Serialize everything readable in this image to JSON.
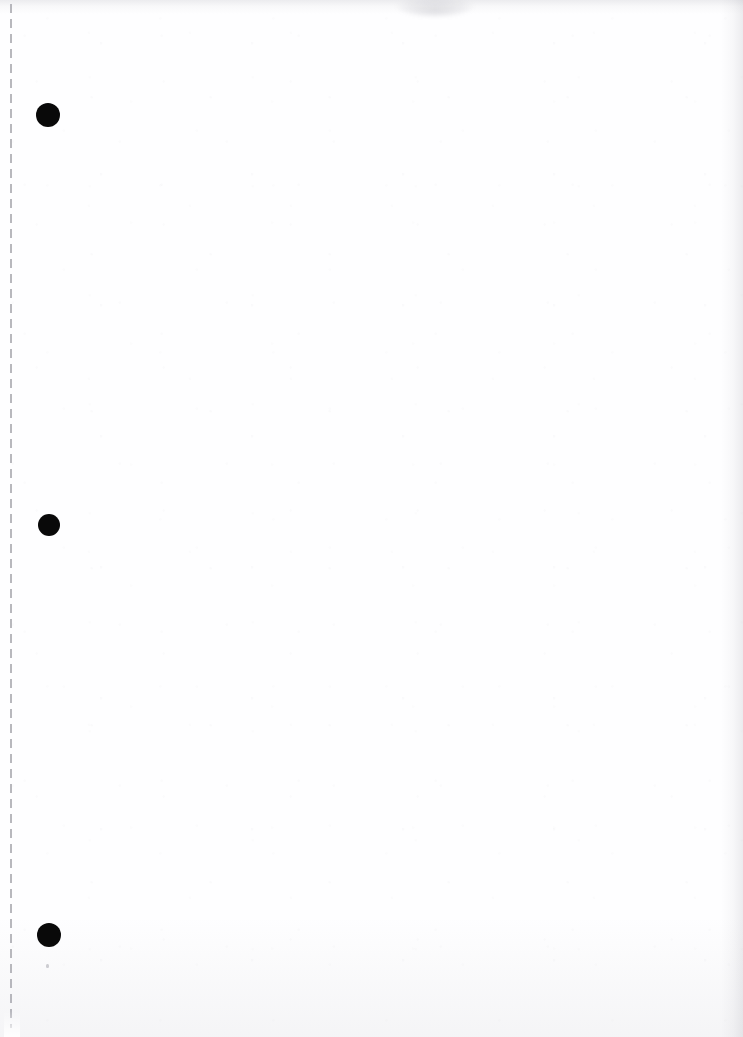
{
  "page": {
    "kind": "scanned-blank-sheet",
    "width_px": 743,
    "height_px": 1037,
    "background_color": "#ffffff",
    "paper_tone_color": "#fefeff",
    "visible_text": "",
    "description_label": ""
  },
  "perforation": {
    "name": "vertical-dashed-perforation-line",
    "color": "#b4b4ba",
    "x_px": 10,
    "top_px": 4,
    "length_px": 1024,
    "stroke_width_px": 2,
    "dash_length_px": 9,
    "gap_length_px": 6,
    "dash_period_px": 15
  },
  "markers": {
    "color": "#090909",
    "count": 3,
    "dots": [
      {
        "label": "",
        "cx_px": 48,
        "cy_px": 115,
        "r_px": 12
      },
      {
        "label": "",
        "cx_px": 49,
        "cy_px": 525,
        "r_px": 11
      },
      {
        "label": "",
        "cx_px": 49,
        "cy_px": 935,
        "r_px": 12
      }
    ]
  },
  "specks": [
    {
      "label": "",
      "x_px": 46,
      "y_px": 964,
      "w_px": 3,
      "h_px": 4,
      "color": "#96969f"
    }
  ],
  "artifacts": {
    "top_smudge": {
      "label": "",
      "x_px": 396,
      "y_px": -4,
      "w_px": 78,
      "h_px": 20,
      "color": "#7d7d8a"
    },
    "top_edge_shadow_color": "#8c8c98",
    "right_edge_shadow_color": "#8c8c98",
    "bottom_haze_color": "#9696a0"
  }
}
